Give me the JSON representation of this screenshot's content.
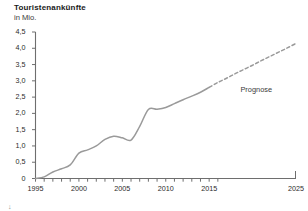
{
  "chart": {
    "title": "Touristenankünfte",
    "subtitle": "in Mio.",
    "forecast_label": "Prognose",
    "corner_mark": "↓"
  },
  "colors": {
    "line": "#9a9a9a",
    "axis": "#6e6e6e",
    "text": "#2b2b2b",
    "title": "#1a1a1a"
  },
  "chart_data": {
    "type": "line",
    "title": "Touristenankünfte",
    "subtitle": "in Mio.",
    "xlabel": "",
    "ylabel": "in Mio.",
    "xlim": [
      1995,
      2025
    ],
    "ylim": [
      0,
      4.5
    ],
    "grid": false,
    "legend_position": "inline-annotation",
    "y_ticks": [
      0,
      0.5,
      1.0,
      1.5,
      2.0,
      2.5,
      3.0,
      3.5,
      4.0,
      4.5
    ],
    "y_tick_labels": [
      "0",
      "0,5",
      "1,0",
      "1,5",
      "2,0",
      "2,5",
      "3,0",
      "3,5",
      "4,0",
      "4,5"
    ],
    "x_ticks": [
      1995,
      2000,
      2005,
      2010,
      2015,
      2025
    ],
    "x_tick_labels": [
      "1995",
      "2000",
      "2005",
      "2010",
      "2015",
      "2025"
    ],
    "x_minor_ticks": [
      1995,
      1996,
      1997,
      1998,
      1999,
      2000,
      2001,
      2002,
      2003,
      2004,
      2005,
      2006,
      2007,
      2008,
      2009,
      2010,
      2011,
      2012,
      2013,
      2014,
      2015,
      2016
    ],
    "series": [
      {
        "name": "Touristenankünfte (Ist)",
        "style": "solid",
        "x": [
          1995,
          1996,
          1997,
          1998,
          1999,
          2000,
          2001,
          2002,
          2003,
          2004,
          2005,
          2006,
          2007,
          2008,
          2009,
          2010,
          2011,
          2012,
          2013,
          2014,
          2015
        ],
        "values": [
          0.0,
          0.05,
          0.2,
          0.3,
          0.42,
          0.78,
          0.88,
          1.0,
          1.2,
          1.3,
          1.25,
          1.18,
          1.6,
          2.12,
          2.13,
          2.18,
          2.3,
          2.42,
          2.53,
          2.65,
          2.8
        ]
      },
      {
        "name": "Prognose",
        "style": "dashed",
        "x": [
          2015,
          2016,
          2017,
          2018,
          2019,
          2020,
          2021,
          2022,
          2023,
          2024,
          2025
        ],
        "values": [
          2.8,
          2.95,
          3.08,
          3.22,
          3.35,
          3.48,
          3.62,
          3.75,
          3.88,
          4.01,
          4.15
        ]
      }
    ],
    "annotations": [
      {
        "text": "Prognose",
        "x": 2018.6,
        "y": 2.72
      }
    ]
  }
}
